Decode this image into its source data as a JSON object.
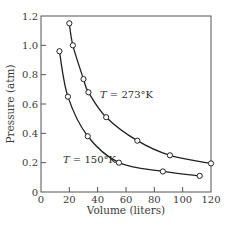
{
  "chart_data": {
    "type": "line",
    "title": "",
    "xlabel": "Volume (liters)",
    "ylabel": "Pressure (atm)",
    "xlim": [
      0,
      120
    ],
    "ylim": [
      0,
      1.2
    ],
    "xticks": [
      0,
      20,
      40,
      60,
      80,
      100,
      120
    ],
    "yticks": [
      0,
      0.2,
      0.4,
      0.6,
      0.8,
      1.0,
      1.2
    ],
    "xtick_labels": [
      "0",
      "20",
      "40",
      "60",
      "80",
      "100",
      "120"
    ],
    "ytick_labels": [
      "0",
      "0.2",
      "0.4",
      "0.6",
      "0.8",
      "1.0",
      "1.2"
    ],
    "grid": false,
    "legend": "none (curves labeled inline)",
    "series": [
      {
        "name": "T = 273°K",
        "label": "T = 273°K",
        "marker": "open circle",
        "x": [
          20,
          22.5,
          30,
          33.5,
          46,
          68,
          91,
          120
        ],
        "y": [
          1.15,
          1.0,
          0.77,
          0.68,
          0.51,
          0.35,
          0.25,
          0.195
        ]
      },
      {
        "name": "T = 150°K",
        "label": "T = 150°K",
        "marker": "open circle",
        "x": [
          13,
          19,
          33,
          55,
          86,
          112
        ],
        "y": [
          0.96,
          0.65,
          0.38,
          0.2,
          0.14,
          0.11
        ]
      }
    ],
    "annotations": [
      "T = 273°K",
      "T = 150°K"
    ]
  },
  "labels": {
    "x_axis_title": "Volume (liters)",
    "y_axis_title": "Pressure (atm)",
    "curve_273": "T = 273°K",
    "curve_150": "T = 150°K",
    "x_ticks": [
      "0",
      "20",
      "40",
      "60",
      "80",
      "100",
      "120"
    ],
    "y_ticks": [
      "0",
      "0.2",
      "0.4",
      "0.6",
      "0.8",
      "1.0",
      "1.2"
    ]
  }
}
